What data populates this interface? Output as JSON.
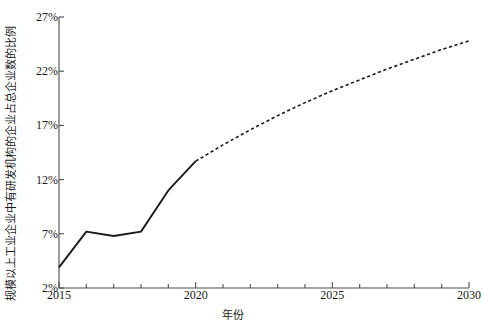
{
  "chart_data": {
    "type": "line",
    "title": "",
    "xlabel": "年份",
    "ylabel": "规模以上工业企业中有研发机构的企业占总企业数的比例",
    "xlim": [
      2015,
      2030
    ],
    "ylim": [
      2,
      27
    ],
    "grid": false,
    "legend": "none",
    "xticks": [
      "2015",
      "2020",
      "2025",
      "2030"
    ],
    "xtick_values": [
      2015,
      2020,
      2025,
      2030
    ],
    "xminor_step": 1,
    "yticks": [
      "2%",
      "7%",
      "12%",
      "17%",
      "22%",
      "27%"
    ],
    "ytick_values": [
      2,
      7,
      12,
      17,
      22,
      27
    ],
    "x": [
      2015,
      2016,
      2017,
      2018,
      2019,
      2020,
      2021,
      2022,
      2023,
      2024,
      2025,
      2026,
      2027,
      2028,
      2029,
      2030
    ],
    "series": [
      {
        "name": "historical",
        "style": "solid",
        "color": "#1a1a1a",
        "x": [
          2015,
          2016,
          2017,
          2018,
          2019,
          2020
        ],
        "values": [
          3.9,
          7.2,
          6.8,
          7.2,
          11.0,
          13.7
        ]
      },
      {
        "name": "projection",
        "style": "dashed",
        "color": "#1a1a1a",
        "x": [
          2020,
          2021,
          2022,
          2023,
          2024,
          2025,
          2026,
          2027,
          2028,
          2029,
          2030
        ],
        "values": [
          13.7,
          15.2,
          16.6,
          17.9,
          19.1,
          20.2,
          21.2,
          22.2,
          23.1,
          24.0,
          24.8
        ]
      }
    ]
  },
  "axes": {
    "y_title": "规模以上工业企业中有研发机构的企业占总企业数的比例",
    "x_title": "年份",
    "y_tick_labels": [
      "27%",
      "22%",
      "17%",
      "12%",
      "7%",
      "2%"
    ],
    "x_tick_labels": [
      "2015",
      "2020",
      "2025",
      "2030"
    ]
  },
  "style": {
    "line_color": "#1a1a1a",
    "axis_color": "#4d4d4d",
    "background": "#ffffff"
  }
}
